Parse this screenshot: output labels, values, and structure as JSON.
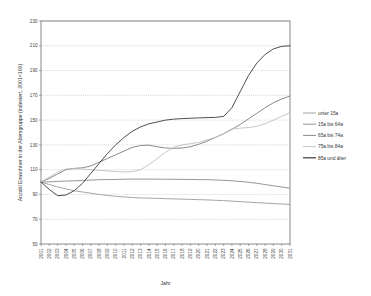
{
  "chart_data": {
    "type": "line",
    "title": "",
    "xlabel": "Jahr",
    "ylabel": "Anzahl Einwohner in der Altersgruppe (indexiert, 2001=100)",
    "xlim": [
      2001,
      2031
    ],
    "ylim": [
      50,
      230
    ],
    "ytick_step": 20,
    "yticks": [
      50,
      70,
      90,
      110,
      130,
      150,
      170,
      190,
      210,
      230
    ],
    "grid": true,
    "legend_position": "right",
    "x": [
      2001,
      2002,
      2003,
      2004,
      2005,
      2006,
      2007,
      2008,
      2009,
      2010,
      2011,
      2012,
      2013,
      2014,
      2015,
      2016,
      2017,
      2018,
      2019,
      2020,
      2021,
      2022,
      2023,
      2024,
      2025,
      2026,
      2027,
      2028,
      2029,
      2030,
      2031
    ],
    "categories": [
      "2001",
      "2002",
      "2003",
      "2004",
      "2005",
      "2006",
      "2007",
      "2008",
      "2009",
      "2010",
      "2011",
      "2012",
      "2013",
      "2014",
      "2015",
      "2016",
      "2017",
      "2018",
      "2019",
      "2020",
      "2021",
      "2022",
      "2023",
      "2024",
      "2025",
      "2026",
      "2027",
      "2028",
      "2029",
      "2030",
      "2031"
    ],
    "series": [
      {
        "name": "unter 15a",
        "color": "#9b9b9b",
        "values": [
          100,
          98,
          96,
          94.5,
          93,
          92,
          91,
          90,
          89.2,
          88.5,
          88,
          87.5,
          87.2,
          87,
          86.8,
          86.6,
          86.4,
          86.2,
          86,
          85.8,
          85.6,
          85.3,
          85,
          84.6,
          84.2,
          83.8,
          83.4,
          83,
          82.6,
          82.3,
          82
        ]
      },
      {
        "name": "15a bis 64a",
        "color": "#8a8a8a",
        "values": [
          100,
          100.2,
          100.5,
          100.8,
          101,
          101.3,
          101.6,
          101.9,
          102,
          102.1,
          102.3,
          102.4,
          102.4,
          102.4,
          102.3,
          102.3,
          102.2,
          102.2,
          102.1,
          102,
          101.9,
          101.7,
          101.4,
          101,
          100.5,
          99.8,
          99,
          98,
          97,
          96,
          95
        ]
      },
      {
        "name": "65a bis 74a",
        "color": "#7d7d7d",
        "values": [
          100,
          103,
          106.5,
          110,
          111,
          111.5,
          113,
          116,
          119,
          122,
          125,
          128,
          129.5,
          129.8,
          128.5,
          127.5,
          127.2,
          127.5,
          128.5,
          130.5,
          133,
          136,
          139,
          142.5,
          146.5,
          151,
          155.5,
          160,
          164,
          167,
          169.5
        ]
      },
      {
        "name": "75a bis 84a",
        "color": "#c0c0c0",
        "values": [
          100,
          104,
          108,
          110.5,
          110.8,
          110.5,
          110,
          109.5,
          109,
          108.5,
          108.2,
          108.5,
          110,
          114,
          119,
          124,
          128,
          130,
          131,
          132,
          134,
          136,
          139,
          143,
          143.5,
          144,
          145,
          147,
          150,
          153,
          156
        ]
      },
      {
        "name": "85a und älter",
        "color": "#3a3a3a",
        "values": [
          100,
          94,
          89,
          89.5,
          93,
          99,
          107,
          115,
          123,
          130,
          136,
          141,
          144.5,
          147,
          148.5,
          150,
          150.8,
          151.2,
          151.5,
          151.8,
          152,
          152.2,
          153,
          160,
          173,
          186,
          196,
          203,
          207.5,
          209.5,
          210
        ]
      }
    ]
  },
  "legend": {
    "items": [
      {
        "label": "unter 15a"
      },
      {
        "label": "15a bis 64a"
      },
      {
        "label": "65a bis 74a"
      },
      {
        "label": "75a bis 84a"
      },
      {
        "label": "85a und älter"
      }
    ]
  }
}
